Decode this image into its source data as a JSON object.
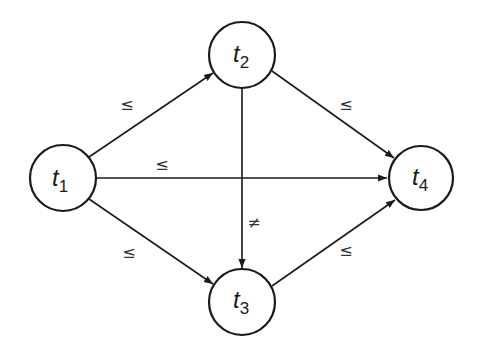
{
  "diagram": {
    "type": "directed-graph",
    "nodes": [
      {
        "id": "t1",
        "base": "t",
        "sub": "1",
        "cx": 63,
        "cy": 178,
        "r": 33
      },
      {
        "id": "t2",
        "base": "t",
        "sub": "2",
        "cx": 242,
        "cy": 55,
        "r": 33
      },
      {
        "id": "t3",
        "base": "t",
        "sub": "3",
        "cx": 242,
        "cy": 302,
        "r": 33
      },
      {
        "id": "t4",
        "base": "t",
        "sub": "4",
        "cx": 421,
        "cy": 178,
        "r": 32
      }
    ],
    "edges": [
      {
        "from": "t1",
        "to": "t2",
        "label": "≤"
      },
      {
        "from": "t1",
        "to": "t4",
        "label": "≤"
      },
      {
        "from": "t1",
        "to": "t3",
        "label": "≤"
      },
      {
        "from": "t2",
        "to": "t4",
        "label": "≤"
      },
      {
        "from": "t2",
        "to": "t3",
        "label": "≠"
      },
      {
        "from": "t3",
        "to": "t4",
        "label": "≤"
      }
    ]
  }
}
